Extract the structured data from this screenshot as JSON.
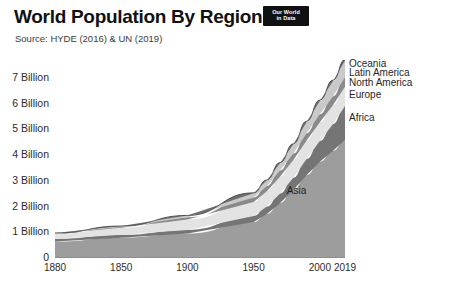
{
  "header": {
    "title": "World Population By Region",
    "subtitle": "Source: HYDE (2016) & UN (2019)",
    "logo_line1": "Our World",
    "logo_line2": "in Data"
  },
  "chart_data": {
    "type": "area",
    "title": "World Population By Region",
    "subtitle": "Source: HYDE (2016) & UN (2019)",
    "xlabel": "",
    "ylabel": "",
    "stacked": true,
    "grid": false,
    "legend_position": "right-inline",
    "xlim": [
      1800,
      2019
    ],
    "ylim": [
      0,
      7.7
    ],
    "y_tick_values": [
      0,
      1,
      2,
      3,
      4,
      5,
      6,
      7
    ],
    "y_tick_labels": [
      "0",
      "1 Billion",
      "2 Billion",
      "3 Billion",
      "4 Billion",
      "5 Billion",
      "6 Billion",
      "7 Billion"
    ],
    "x_tick_values": [
      1800,
      1850,
      1900,
      1950,
      2000,
      2019
    ],
    "x_tick_labels": [
      "1880",
      "1850",
      "1900",
      "1950",
      "2000",
      "2019"
    ],
    "x": [
      1800,
      1850,
      1900,
      1950,
      1960,
      1970,
      1980,
      1990,
      2000,
      2010,
      2019
    ],
    "series": [
      {
        "name": "Asia",
        "color": "#9d9d9d",
        "label_x": 1975,
        "label_y": 2.6,
        "values": [
          0.64,
          0.79,
          0.95,
          1.4,
          1.71,
          2.14,
          2.64,
          3.22,
          3.74,
          4.17,
          4.6
        ]
      },
      {
        "name": "Africa",
        "color": "#757575",
        "label_x": 2022,
        "label_y": 5.45,
        "values": [
          0.1,
          0.11,
          0.14,
          0.23,
          0.29,
          0.37,
          0.48,
          0.63,
          0.81,
          1.04,
          1.31
        ]
      },
      {
        "name": "Europe",
        "color": "#e3e3e3",
        "label_x": 2022,
        "label_y": 6.35,
        "values": [
          0.2,
          0.28,
          0.41,
          0.55,
          0.6,
          0.66,
          0.69,
          0.72,
          0.73,
          0.74,
          0.75
        ]
      },
      {
        "name": "North America",
        "color": "#8a8a8a",
        "label_x": 2022,
        "label_y": 6.8,
        "values": [
          0.01,
          0.03,
          0.08,
          0.17,
          0.2,
          0.23,
          0.25,
          0.28,
          0.31,
          0.34,
          0.37
        ]
      },
      {
        "name": "Latin America",
        "color": "#c9c9c9",
        "label_x": 2022,
        "label_y": 7.2,
        "values": [
          0.02,
          0.03,
          0.07,
          0.17,
          0.22,
          0.29,
          0.36,
          0.44,
          0.52,
          0.59,
          0.65
        ]
      },
      {
        "name": "Oceania",
        "color": "#6f6f6f",
        "label_x": 2022,
        "label_y": 7.55,
        "values": [
          0.002,
          0.002,
          0.006,
          0.013,
          0.016,
          0.02,
          0.023,
          0.027,
          0.031,
          0.037,
          0.042
        ]
      }
    ]
  },
  "legend": {
    "items": [
      "Oceania",
      "Latin America",
      "North America",
      "Europe",
      "Africa",
      "Asia"
    ]
  }
}
